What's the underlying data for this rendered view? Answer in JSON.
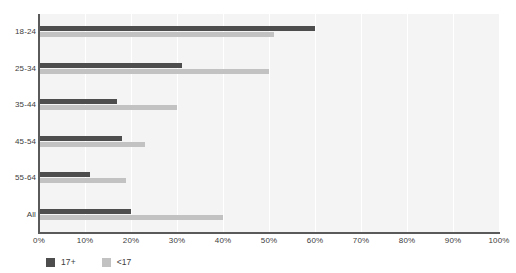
{
  "chart_data": {
    "type": "bar",
    "orientation": "horizontal",
    "title": "",
    "xlabel": "",
    "ylabel": "",
    "xlim": [
      0,
      100
    ],
    "xticks": [
      0,
      10,
      20,
      30,
      40,
      50,
      60,
      70,
      80,
      90,
      100
    ],
    "xtick_labels": [
      "0%",
      "10%",
      "20%",
      "30%",
      "40%",
      "50%",
      "60%",
      "70%",
      "80%",
      "90%",
      "100%"
    ],
    "categories": [
      "18-24",
      "25-34",
      "35-44",
      "45-54",
      "55-64",
      "All"
    ],
    "series": [
      {
        "name": "17+",
        "color": "#4d4d4d",
        "values": [
          60,
          31,
          17,
          18,
          11,
          20
        ]
      },
      {
        "name": "<17",
        "color": "#c2c2c2",
        "values": [
          51,
          50,
          30,
          23,
          19,
          40
        ]
      }
    ],
    "legend": {
      "position": "below-left",
      "entries": [
        {
          "label": "17+",
          "color": "#4d4d4d"
        },
        {
          "label": "<17",
          "color": "#c2c2c2"
        }
      ]
    },
    "grid": {
      "vertical": true,
      "horizontal": false,
      "color": "#ffffff"
    },
    "plot_background": "#f4f4f4",
    "axis_color": "#5a5a5a"
  }
}
